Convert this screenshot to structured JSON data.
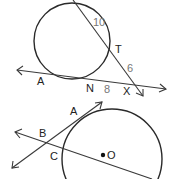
{
  "top_figure": {
    "labels": {
      "segment_outer_chord": "10",
      "point_T": "T",
      "segment_TX": "6",
      "point_A": "A",
      "point_N": "N",
      "segment_NX": "8",
      "point_X": "X"
    }
  },
  "bottom_figure": {
    "labels": {
      "point_A": "A",
      "point_B": "B",
      "point_C": "C",
      "center_O": "O"
    }
  }
}
